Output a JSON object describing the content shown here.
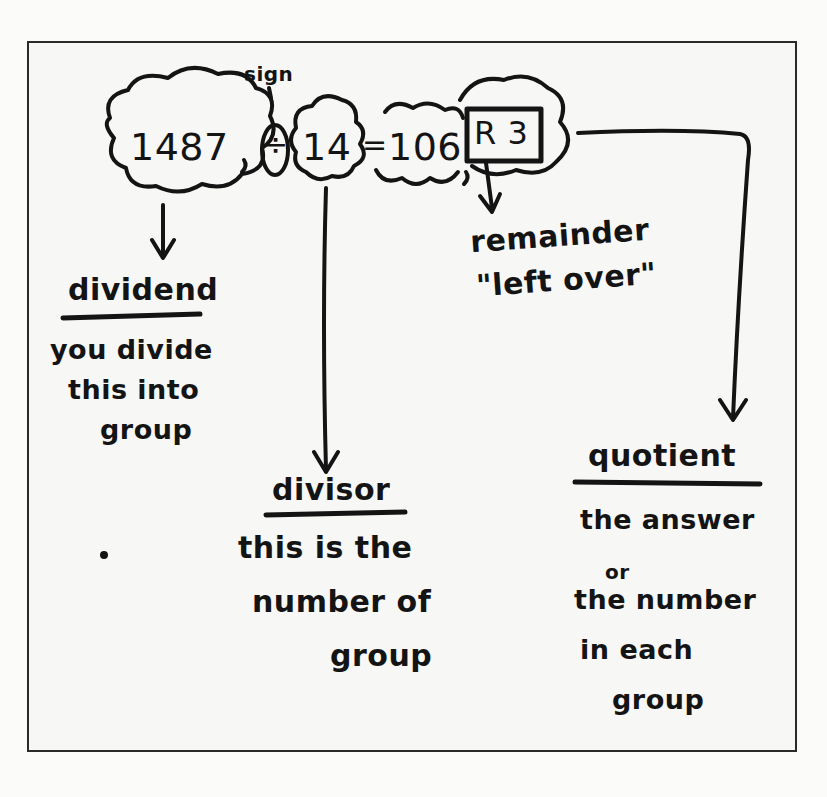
{
  "equation": {
    "dividend": "1487",
    "sign": "÷",
    "divisor": "14",
    "equals": "=",
    "quotient": "106",
    "remainder": "R 3",
    "sign_label": "sign"
  },
  "labels": {
    "dividend": {
      "term": "dividend",
      "lines": [
        "you divide",
        "this into",
        "group"
      ]
    },
    "divisor": {
      "term": "divisor",
      "lines": [
        "this is the",
        "number of",
        "group"
      ]
    },
    "remainder": {
      "term": "remainder",
      "lines": [
        "\"left over\""
      ]
    },
    "quotient": {
      "term": "quotient",
      "lines": [
        "the answer",
        "or",
        "the number",
        "in each",
        "group"
      ]
    }
  },
  "colors": {
    "ink": "#141414",
    "paper": "#f7f7f6",
    "border": "#2a2a2a"
  }
}
